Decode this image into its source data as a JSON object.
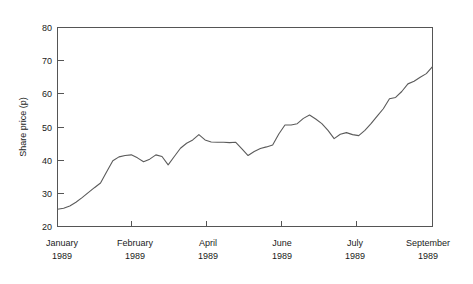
{
  "chart_data": {
    "type": "line",
    "title": "",
    "subtitle": "",
    "xlabel": "",
    "ylabel": "Share price (p)",
    "ylim": [
      20,
      80
    ],
    "yticks": [
      20,
      30,
      40,
      50,
      60,
      70,
      80
    ],
    "ytick_labels": [
      "20",
      "30",
      "40",
      "50",
      "60",
      "70",
      "80"
    ],
    "xtick_labels": [
      {
        "month": "January",
        "year": "1989"
      },
      {
        "month": "February",
        "year": "1989"
      },
      {
        "month": "April",
        "year": "1989"
      },
      {
        "month": "June",
        "year": "1989"
      },
      {
        "month": "July",
        "year": "1989"
      },
      {
        "month": "September",
        "year": "1989"
      }
    ],
    "grid": false,
    "legend": false,
    "legend_position": "none",
    "line_color": "#5b5b5b",
    "axis_color": "#555555",
    "background_color": "#ffffff",
    "series": [
      {
        "name": "Share price",
        "x": [
          0,
          1,
          2,
          3,
          4,
          5,
          6,
          7,
          8,
          9,
          10,
          11,
          12,
          13,
          14,
          15,
          16,
          17,
          18,
          19,
          20,
          21,
          22,
          23,
          24,
          25,
          26,
          27,
          28,
          29,
          30,
          31,
          32,
          33,
          34,
          35,
          36,
          37,
          38,
          39,
          40,
          41,
          42,
          43,
          44,
          45,
          46,
          47,
          48,
          49
        ],
        "values": [
          25.2,
          25.5,
          26.2,
          27.3,
          28.7,
          30.2,
          31.7,
          33.1,
          36.5,
          39.8,
          41.0,
          41.4,
          41.6,
          40.7,
          39.5,
          40.3,
          41.6,
          41.1,
          38.6,
          41.1,
          43.6,
          45.1,
          46.1,
          47.7,
          46.1,
          45.5,
          45.4,
          45.4,
          45.3,
          45.4,
          43.4,
          41.4,
          42.6,
          43.5,
          44.0,
          44.6,
          47.9,
          50.6,
          50.6,
          51.0,
          52.6,
          53.6,
          52.4,
          51.0,
          49.0,
          46.5,
          47.8,
          48.3,
          47.7,
          47.4
        ]
      }
    ],
    "series_tail": {
      "x": [
        50,
        51,
        52,
        53,
        54,
        55,
        56,
        57,
        58,
        59,
        60,
        61
      ],
      "values": [
        49.0,
        51.0,
        53.3,
        55.5,
        58.5,
        58.9,
        60.7,
        63.0,
        63.8,
        65.0,
        66.1,
        68.2
      ]
    }
  },
  "axis": {
    "y_title": "Share price (p)"
  }
}
